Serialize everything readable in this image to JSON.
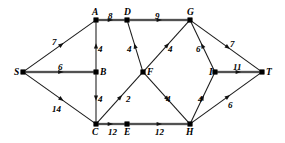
{
  "figure": {
    "type": "directed-weighted-graph",
    "title": "",
    "background_color": "#ffffff",
    "edge_color": "#1a1a1a",
    "highlight_edge_color": "#8a8a8a",
    "node_color": "#000000",
    "width": 285,
    "height": 143
  },
  "nodes": [
    {
      "id": "S",
      "label": "S",
      "x": 23,
      "y": 72,
      "label_dx": -9,
      "label_dy": -4
    },
    {
      "id": "A",
      "label": "A",
      "x": 96,
      "y": 20,
      "label_dx": -4,
      "label_dy": -12
    },
    {
      "id": "D",
      "label": "D",
      "x": 127,
      "y": 20,
      "label_dx": -3,
      "label_dy": -12
    },
    {
      "id": "G",
      "label": "G",
      "x": 190,
      "y": 20,
      "label_dx": -3,
      "label_dy": -12
    },
    {
      "id": "B",
      "label": "B",
      "x": 96,
      "y": 72,
      "label_dx": 4,
      "label_dy": -4
    },
    {
      "id": "F",
      "label": "F",
      "x": 143,
      "y": 72,
      "label_dx": 4,
      "label_dy": -4
    },
    {
      "id": "I",
      "label": "I",
      "x": 215,
      "y": 72,
      "label_dx": -6,
      "label_dy": -4
    },
    {
      "id": "T",
      "label": "T",
      "x": 262,
      "y": 72,
      "label_dx": 4,
      "label_dy": -4
    },
    {
      "id": "C",
      "label": "C",
      "x": 96,
      "y": 124,
      "label_dx": -4,
      "label_dy": 4
    },
    {
      "id": "E",
      "label": "E",
      "x": 127,
      "y": 124,
      "label_dx": -3,
      "label_dy": 4
    },
    {
      "id": "H",
      "label": "H",
      "x": 190,
      "y": 124,
      "label_dx": -4,
      "label_dy": 4
    }
  ],
  "edges": [
    {
      "from": "S",
      "to": "A",
      "weight": "7",
      "label_x": 52,
      "label_y": 38,
      "highlight": false
    },
    {
      "from": "S",
      "to": "B",
      "weight": "6",
      "label_x": 58,
      "label_y": 63,
      "highlight": true
    },
    {
      "from": "S",
      "to": "C",
      "weight": "14",
      "label_x": 52,
      "label_y": 105,
      "highlight": false
    },
    {
      "from": "A",
      "to": "D",
      "weight": "8",
      "label_x": 108,
      "label_y": 12,
      "highlight": true
    },
    {
      "from": "D",
      "to": "G",
      "weight": "9",
      "label_x": 155,
      "label_y": 12,
      "highlight": true
    },
    {
      "from": "B",
      "to": "A",
      "weight": "4",
      "label_x": 98,
      "label_y": 45,
      "highlight": false
    },
    {
      "from": "F",
      "to": "D",
      "weight": "4",
      "label_x": 127,
      "label_y": 45,
      "highlight": false
    },
    {
      "from": "B",
      "to": "C",
      "weight": "4",
      "label_x": 98,
      "label_y": 95,
      "highlight": false
    },
    {
      "from": "C",
      "to": "F",
      "weight": "2",
      "label_x": 126,
      "label_y": 95,
      "highlight": false
    },
    {
      "from": "C",
      "to": "E",
      "weight": "12",
      "label_x": 108,
      "label_y": 128,
      "highlight": true
    },
    {
      "from": "E",
      "to": "H",
      "weight": "12",
      "label_x": 155,
      "label_y": 128,
      "highlight": true
    },
    {
      "from": "F",
      "to": "G",
      "weight": "4",
      "label_x": 168,
      "label_y": 45,
      "highlight": false
    },
    {
      "from": "F",
      "to": "H",
      "weight": "4",
      "label_x": 166,
      "label_y": 95,
      "highlight": false
    },
    {
      "from": "I",
      "to": "G",
      "weight": "6",
      "label_x": 196,
      "label_y": 45,
      "highlight": false
    },
    {
      "from": "H",
      "to": "I",
      "weight": "4",
      "label_x": 198,
      "label_y": 95,
      "highlight": false
    },
    {
      "from": "G",
      "to": "T",
      "weight": "7",
      "label_x": 230,
      "label_y": 40,
      "highlight": false
    },
    {
      "from": "I",
      "to": "T",
      "weight": "11",
      "label_x": 233,
      "label_y": 63,
      "highlight": true
    },
    {
      "from": "H",
      "to": "T",
      "weight": "6",
      "label_x": 228,
      "label_y": 101,
      "highlight": false
    }
  ]
}
